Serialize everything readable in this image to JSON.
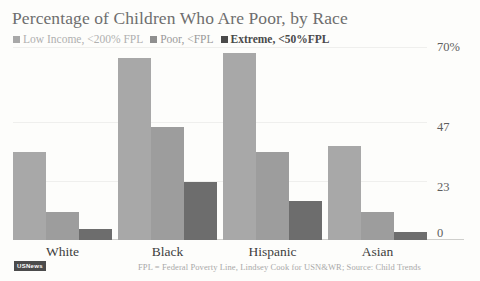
{
  "chart_data": {
    "type": "bar",
    "title": "Percentage of Children Who Are Poor, by Race",
    "xlabel": "",
    "ylabel": "",
    "categories": [
      "White",
      "Black",
      "Hispanic",
      "Asian"
    ],
    "series": [
      {
        "name": "Low Income, <200% FPL",
        "color": "#a8a8a8",
        "values": [
          32,
          66,
          68,
          34
        ]
      },
      {
        "name": "Poor, <FPL",
        "color": "#9d9d9d",
        "values": [
          10,
          41,
          32,
          10
        ]
      },
      {
        "name": "Extreme, <50%FPL",
        "color": "#6d6d6d",
        "values": [
          4,
          21,
          14,
          3
        ]
      }
    ],
    "ylim": [
      0,
      70
    ],
    "yticks": [
      0,
      23,
      47,
      70
    ],
    "ytick_labels": [
      "0",
      "23",
      "47",
      "70%"
    ],
    "grid": true,
    "legend_position": "top-left",
    "annotation": "FPL = Federal Poverty Line, Lindsey Cook for USN&WR; Source: Child Trends",
    "source_badge": "USNews"
  }
}
